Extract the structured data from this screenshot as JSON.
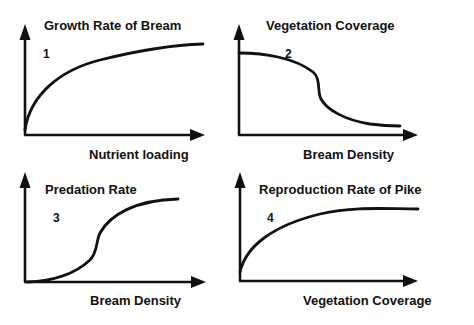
{
  "panels": [
    {
      "id": 1,
      "number": "1",
      "y_label": "Growth Rate of Bream",
      "x_label": "Nutrient loading",
      "shape": "saturating increase"
    },
    {
      "id": 2,
      "number": "2",
      "y_label": "Vegetation  Coverage",
      "x_label": "Bream  Density",
      "shape": "decreasing with sharp drop (threshold)"
    },
    {
      "id": 3,
      "number": "3",
      "y_label": "Predation  Rate",
      "x_label": "Bream  Density",
      "shape": "sigmoid increase"
    },
    {
      "id": 4,
      "number": "4",
      "y_label": "Reproduction  Rate  of  Pike",
      "x_label": "Vegetation  Coverage",
      "shape": "saturating increase"
    }
  ],
  "colors": {
    "ink": "#111111",
    "background": "#ffffff"
  }
}
